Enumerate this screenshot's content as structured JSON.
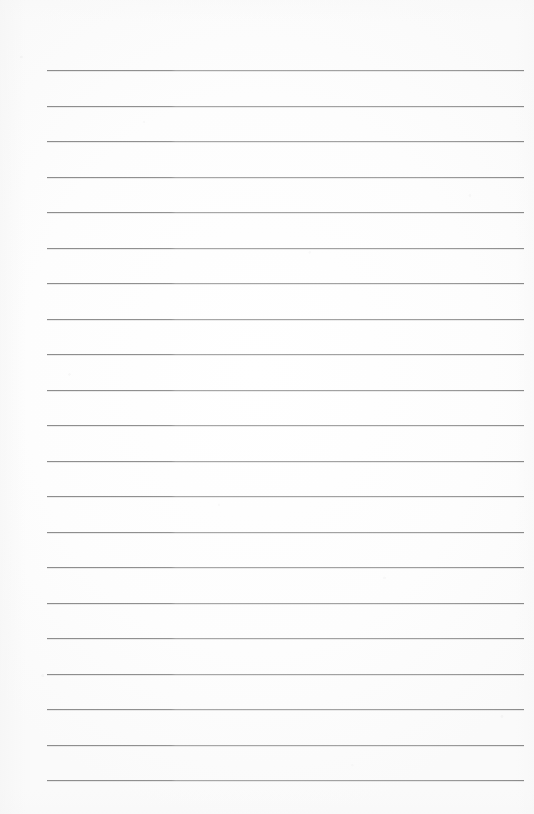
{
  "document": {
    "type": "scanned-lined-notebook-page",
    "title": "",
    "body_text": "",
    "visible_text": "",
    "page_width": 534,
    "page_height": 814,
    "background_color": "#fefefe",
    "is_blank": true
  },
  "ruling": {
    "line_color": "#919191",
    "line_color_right_segment": "#a4a4a4",
    "line_thickness": 1,
    "line_count": 21,
    "left_x": 47,
    "right_x": 524,
    "first_line_y": 70,
    "line_spacing": 35.5,
    "tone_break_x": 188,
    "lines_y": [
      70,
      105.5,
      141,
      176.5,
      212,
      247.5,
      283,
      318.5,
      354,
      389.5,
      425,
      460.5,
      496,
      531.5,
      567,
      602.5,
      638,
      673.5,
      709,
      744.5,
      780
    ]
  },
  "margins": {
    "top": 70,
    "left": 47,
    "right": 10,
    "bottom": 34,
    "has_vertical_margin_rule": false
  }
}
